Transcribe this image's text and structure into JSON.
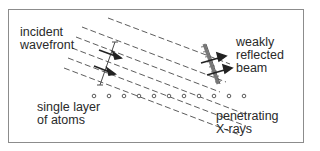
{
  "diagram": {
    "type": "x-ray reflection from single atomic layer",
    "labels": {
      "incident_wavefront": [
        "incident",
        "wavefront"
      ],
      "weakly_reflected_beam": [
        "weakly",
        "reflected",
        "beam"
      ],
      "single_layer_of_atoms": [
        "single layer",
        "of atoms"
      ],
      "penetrating_xrays": [
        "penetrating",
        "X-rays"
      ]
    },
    "atoms": {
      "count": 11,
      "row_y": 96,
      "x_positions": [
        94,
        109,
        124,
        139,
        154,
        169,
        184,
        199,
        214,
        229,
        244
      ]
    },
    "colors": {
      "line": "#4a4a4a",
      "frame": "#8c8c8c",
      "text": "#2a2a2a",
      "hatch": "#777777"
    }
  }
}
